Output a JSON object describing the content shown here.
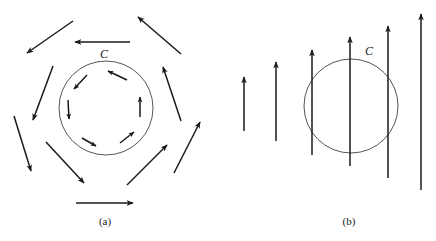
{
  "figure": {
    "panels": [
      {
        "id": "a",
        "caption": "(a)",
        "caption_pos": [
          105,
          225
        ],
        "curve": {
          "label": "C",
          "label_pos": [
            104,
            58
          ],
          "cx": 106,
          "cy": 108,
          "r": 47
        },
        "outer_arrows": [
          {
            "x1": 73,
            "y1": 21,
            "x2": 27,
            "y2": 53
          },
          {
            "x1": 130,
            "y1": 42,
            "x2": 75,
            "y2": 42
          },
          {
            "x1": 181,
            "y1": 54,
            "x2": 138,
            "y2": 17
          },
          {
            "x1": 181,
            "y1": 121,
            "x2": 163,
            "y2": 67
          },
          {
            "x1": 174,
            "y1": 173,
            "x2": 200,
            "y2": 122
          },
          {
            "x1": 127,
            "y1": 185,
            "x2": 167,
            "y2": 145
          },
          {
            "x1": 76,
            "y1": 203,
            "x2": 133,
            "y2": 203
          },
          {
            "x1": 46,
            "y1": 142,
            "x2": 84,
            "y2": 183
          },
          {
            "x1": 14,
            "y1": 116,
            "x2": 31,
            "y2": 171
          },
          {
            "x1": 53,
            "y1": 66,
            "x2": 33,
            "y2": 120
          }
        ],
        "inner_arrows": [
          {
            "x1": 127,
            "y1": 80,
            "x2": 108,
            "y2": 71
          },
          {
            "x1": 87,
            "y1": 75,
            "x2": 74,
            "y2": 89
          },
          {
            "x1": 68,
            "y1": 100,
            "x2": 69,
            "y2": 119
          },
          {
            "x1": 82,
            "y1": 138,
            "x2": 96,
            "y2": 146
          },
          {
            "x1": 120,
            "y1": 143,
            "x2": 134,
            "y2": 132
          },
          {
            "x1": 140,
            "y1": 117,
            "x2": 140,
            "y2": 97
          }
        ]
      },
      {
        "id": "b",
        "caption": "(b)",
        "caption_pos": [
          349,
          225
        ],
        "curve": {
          "label": "C",
          "label_pos": [
            369,
            55
          ],
          "cx": 351,
          "cy": 106,
          "r": 47
        },
        "arrows": [
          {
            "x": 244,
            "y_bottom": 131,
            "y_top": 77
          },
          {
            "x": 276,
            "y_bottom": 141,
            "y_top": 62
          },
          {
            "x": 312,
            "y_bottom": 155,
            "y_top": 50
          },
          {
            "x": 350,
            "y_bottom": 166,
            "y_top": 37
          },
          {
            "x": 388,
            "y_bottom": 178,
            "y_top": 26
          },
          {
            "x": 421,
            "y_bottom": 190,
            "y_top": 14
          }
        ]
      }
    ],
    "colors": {
      "stroke": "#1a1a1a",
      "circle": "#555555",
      "background": "#ffffff"
    }
  }
}
